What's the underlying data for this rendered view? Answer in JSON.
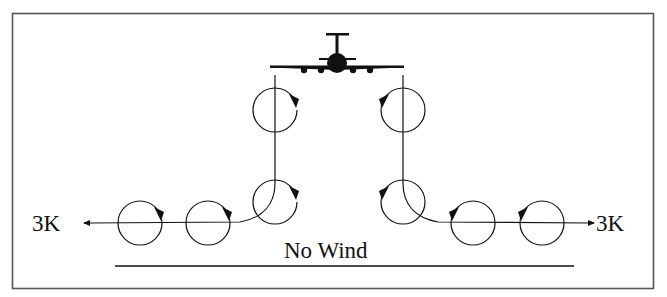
{
  "diagram": {
    "title_condition": "No Wind",
    "left_distance_label": "3K",
    "right_distance_label": "3K",
    "colors": {
      "stroke": "#111111",
      "frame": "#555555",
      "background": "#ffffff"
    },
    "aircraft": {
      "icon": "airplane-front-view-icon",
      "x": 337,
      "y": 63
    },
    "vortices": {
      "left": [
        {
          "position": "descending-upper",
          "cx": 275,
          "cy": 108,
          "rotation": "clockwise"
        },
        {
          "position": "descending-lower",
          "cx": 275,
          "cy": 201,
          "rotation": "clockwise"
        },
        {
          "position": "lateral-inner",
          "cx": 208,
          "cy": 223,
          "rotation": "clockwise"
        },
        {
          "position": "lateral-outer",
          "cx": 140,
          "cy": 223,
          "rotation": "clockwise"
        }
      ],
      "right": [
        {
          "position": "descending-upper",
          "cx": 403,
          "cy": 108,
          "rotation": "counterclockwise"
        },
        {
          "position": "descending-lower",
          "cx": 403,
          "cy": 201,
          "rotation": "counterclockwise"
        },
        {
          "position": "lateral-inner",
          "cx": 473,
          "cy": 223,
          "rotation": "counterclockwise"
        },
        {
          "position": "lateral-outer",
          "cx": 542,
          "cy": 223,
          "rotation": "counterclockwise"
        }
      ]
    }
  }
}
